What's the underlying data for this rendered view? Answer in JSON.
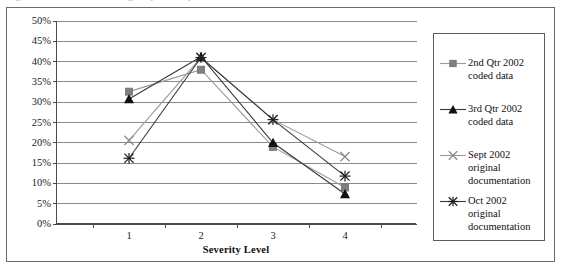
{
  "figure": {
    "caption_remnant": "Figure 3. Percent of discharges by severity level"
  },
  "chart_data": {
    "type": "line",
    "title": "",
    "xlabel": "Severity Level",
    "ylabel": "",
    "categories": [
      "1",
      "2",
      "3",
      "4"
    ],
    "x_tick_labels": [
      "1",
      "2",
      "3",
      "4"
    ],
    "y_tick_labels": [
      "50%",
      "45%",
      "40%",
      "35%",
      "30%",
      "25%",
      "20%",
      "15%",
      "10%",
      "5%",
      "0%"
    ],
    "y_tick_values": [
      50,
      45,
      40,
      35,
      30,
      25,
      20,
      15,
      10,
      5,
      0
    ],
    "ylim": [
      0,
      50
    ],
    "y_unit": "%",
    "grid": "horizontal",
    "legend_position": "right",
    "series": [
      {
        "name": "2nd Qtr 2002 coded data",
        "label_lines": "2nd Qtr 2002\ncoded data",
        "marker": "square",
        "color": "#808080",
        "line_color": "#9a9a9a",
        "values": [
          32.6,
          38.0,
          19.0,
          9.0
        ]
      },
      {
        "name": "3rd Qtr 2002 coded data",
        "label_lines": "3rd Qtr 2002\ncoded data",
        "marker": "triangle",
        "color": "#111111",
        "line_color": "#3a3a3a",
        "values": [
          30.8,
          41.2,
          20.0,
          7.4
        ]
      },
      {
        "name": "Sept 2002 original documentation",
        "label_lines": "Sept 2002\noriginal\ndocumentation",
        "marker": "x",
        "color": "#8c8c8c",
        "line_color": "#9a9a9a",
        "values": [
          20.6,
          41.0,
          25.7,
          16.6
        ]
      },
      {
        "name": "Oct 2002 original documentation",
        "label_lines": "Oct 2002\noriginal\ndocumentation",
        "marker": "asterisk",
        "color": "#1c1c1c",
        "line_color": "#3a3a3a",
        "values": [
          16.2,
          41.0,
          25.7,
          11.8
        ]
      }
    ]
  }
}
